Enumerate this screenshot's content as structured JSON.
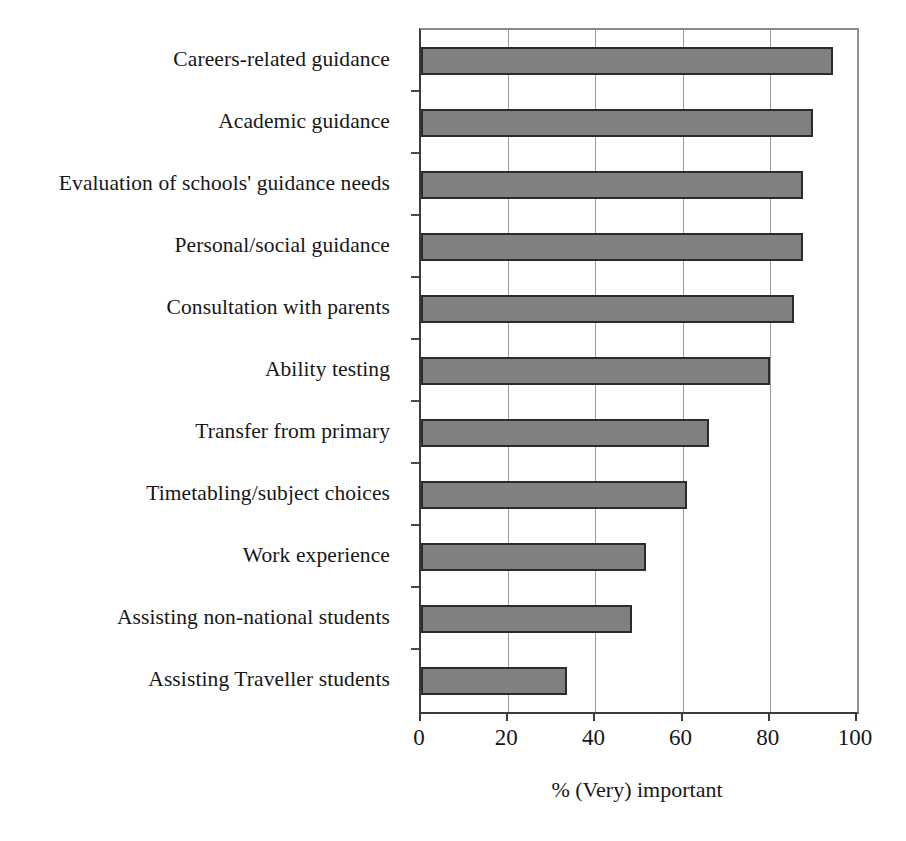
{
  "chart_data": {
    "type": "bar",
    "orientation": "horizontal",
    "title": "",
    "xlabel": "% (Very) important",
    "ylabel": "",
    "xlim": [
      0,
      100
    ],
    "xticks": [
      0,
      20,
      40,
      60,
      80,
      100
    ],
    "xtick_labels": [
      "0",
      "20",
      "40",
      "60",
      "80",
      "100"
    ],
    "grid": "vertical",
    "legend": "none",
    "bar_fill_color": "#808080",
    "bar_edge_color": "#2c2c2c",
    "axis_color": "#3b3b3b",
    "gridline_color": "#9a9a9a",
    "categories": [
      "Careers-related guidance",
      "Academic guidance",
      "Evaluation of schools' guidance needs",
      "Personal/social guidance",
      "Consultation with parents",
      "Ability testing",
      "Transfer from primary",
      "Timetabling/subject choices",
      "Work experience",
      "Assisting non-national students",
      "Assisting Traveller students"
    ],
    "values": [
      94.5,
      90,
      87.5,
      87.5,
      85.5,
      80,
      66,
      61,
      51.5,
      48.5,
      33.5
    ]
  }
}
